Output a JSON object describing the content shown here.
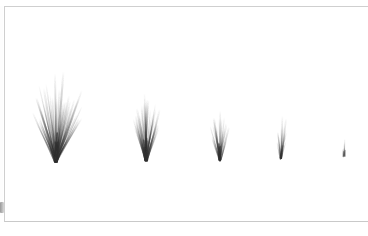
{
  "app": {
    "background_color": "#ffffff",
    "canvas_color": "#ffffff",
    "border_color": "#cfcfcf",
    "ink_color": "#303030"
  },
  "canvas": {
    "label": "Drawing canvas",
    "width": 368,
    "height": 236,
    "sheet": {
      "left": 4,
      "top": 6,
      "right": 368,
      "bottom": 222
    }
  },
  "scrollbar": {
    "label": "Vertical scrollbar",
    "thumb_color": "#9a9a9a",
    "track_color": "#fdfdfd"
  },
  "chart_data": {
    "type": "scatter",
    "title": "",
    "subtitle": "",
    "xlabel": "",
    "ylabel": "",
    "grid": false,
    "legend": null,
    "categories": [
      "stroke-1",
      "stroke-2",
      "stroke-3",
      "stroke-4",
      "stroke-5"
    ],
    "values": [
      85,
      62,
      46,
      40,
      17
    ],
    "x": [
      56,
      146,
      220,
      281,
      344
    ],
    "baseline_y": 161,
    "ink_color": "#303030"
  },
  "strokes": [
    {
      "name": "spray-stroke-1",
      "base_x": 56,
      "base_y": 161,
      "length": 84,
      "spread_deg": 58,
      "tilt_deg": 2,
      "bristles": 34,
      "max_opacity": 0.82,
      "line_width": 1.5,
      "width_px": 88,
      "height_px": 86
    },
    {
      "name": "spray-stroke-2",
      "base_x": 146,
      "base_y": 160,
      "length": 62,
      "spread_deg": 40,
      "tilt_deg": 1,
      "bristles": 26,
      "max_opacity": 0.78,
      "line_width": 1.4,
      "width_px": 50,
      "height_px": 63
    },
    {
      "name": "spray-stroke-3",
      "base_x": 220,
      "base_y": 160,
      "length": 46,
      "spread_deg": 36,
      "tilt_deg": -2,
      "bristles": 17,
      "max_opacity": 0.74,
      "line_width": 1.3,
      "width_px": 38,
      "height_px": 47
    },
    {
      "name": "spray-stroke-4",
      "base_x": 281,
      "base_y": 158,
      "length": 40,
      "spread_deg": 26,
      "tilt_deg": 3,
      "bristles": 10,
      "max_opacity": 0.66,
      "line_width": 1.2,
      "width_px": 27,
      "height_px": 42
    },
    {
      "name": "spray-stroke-5",
      "base_x": 344,
      "base_y": 156,
      "length": 17,
      "spread_deg": 5,
      "tilt_deg": 0,
      "bristles": 4,
      "max_opacity": 0.52,
      "line_width": 1.1,
      "width_px": 5,
      "height_px": 18
    }
  ]
}
